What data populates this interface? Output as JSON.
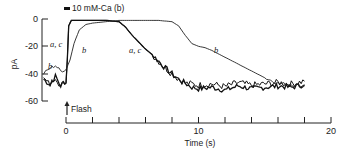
{
  "chart_data": {
    "type": "line",
    "title": "",
    "xlabel": "Time (s)",
    "ylabel": "pA",
    "xlim": [
      -2,
      20
    ],
    "ylim": [
      -60,
      0
    ],
    "x_ticks": [
      0,
      2,
      4,
      6,
      8,
      10,
      12,
      14,
      16,
      18,
      20
    ],
    "x_tick_labels": [
      "0",
      "10",
      "20"
    ],
    "y_ticks": [
      0,
      -20,
      -40,
      -60
    ],
    "y_tick_labels": [
      "0",
      "-20",
      "-40",
      "-60"
    ],
    "grid": false,
    "legend": {
      "text": "10 mM-Ca (b)",
      "position": "top"
    },
    "annotations": [
      {
        "text": "Flash",
        "x": 0,
        "note": "arrow marking flash at t=0"
      },
      {
        "text": "a, c",
        "target": "curve a,c"
      },
      {
        "text": "b",
        "target": "curve b"
      }
    ],
    "series": [
      {
        "name": "a, c",
        "x": [
          -1.7,
          -1.2,
          -0.8,
          -0.4,
          -0.1,
          0.0,
          0.1,
          0.2,
          0.4,
          1,
          2,
          3,
          4,
          4.5,
          5,
          5.5,
          6,
          6.5,
          7,
          7.5,
          8,
          8.5,
          9,
          9.5,
          10,
          11,
          12,
          13,
          14,
          15,
          16,
          17,
          18
        ],
        "values": [
          -44,
          -48,
          -42,
          -49,
          -46,
          -47,
          -30,
          -5,
          -1,
          -1,
          -1,
          -1,
          -2,
          -6,
          -12,
          -17,
          -22,
          -26,
          -31,
          -36,
          -40,
          -44,
          -47,
          -50,
          -51,
          -50,
          -52,
          -49,
          -51,
          -50,
          -49,
          -50,
          -48
        ]
      },
      {
        "name": "b",
        "x": [
          -1.7,
          -1.2,
          -0.8,
          -0.4,
          0.0,
          0.3,
          0.6,
          1,
          1.5,
          2,
          3,
          4,
          5,
          6,
          7,
          8,
          8.5,
          9,
          9.5,
          10,
          10.5,
          11,
          12,
          13,
          14,
          15,
          16,
          17,
          18
        ],
        "values": [
          -40,
          -36,
          -34,
          -38,
          -37,
          -30,
          -18,
          -8,
          -4,
          -3,
          -2,
          -1,
          -1,
          -1,
          -1,
          -2,
          -5,
          -12,
          -18,
          -20,
          -21,
          -23,
          -28,
          -33,
          -38,
          -43,
          -47,
          -48,
          -49
        ]
      }
    ]
  },
  "labels": {
    "y_axis": "pA",
    "x_axis": "Time (s)",
    "legend": "10 mM-Ca (b)",
    "flash": "Flash",
    "tick_0": "0",
    "tick_10": "10",
    "tick_20": "20",
    "ytick_0": "0",
    "ytick_m20": "-20",
    "ytick_m40": "-40",
    "ytick_m60": "-60",
    "curve_ac_left": "a, c",
    "curve_b_left": "b",
    "curve_b_rise": "b",
    "curve_ac_mid": "a, c",
    "curve_b_mid": "b"
  }
}
